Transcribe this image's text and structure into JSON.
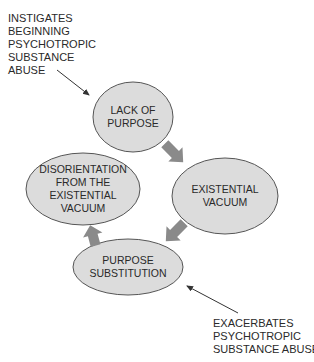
{
  "colors": {
    "node_fill": "#dcdcdc",
    "node_stroke": "#555555",
    "cycle_arrow_fill": "#8a8a8a",
    "pointer_arrow": "#333333",
    "text": "#2a2a2a"
  },
  "annotations": {
    "top": {
      "lines": [
        "INSTIGATES",
        "BEGINNING",
        "PSYCHOTROPIC",
        "SUBSTANCE",
        "ABUSE"
      ]
    },
    "bottom": {
      "lines": [
        "EXACERBATES",
        "PSYCHOTROPIC",
        "SUBSTANCE ABUSE"
      ]
    }
  },
  "nodes": [
    {
      "id": "lack-of-purpose",
      "lines": [
        "LACK OF",
        "PURPOSE"
      ]
    },
    {
      "id": "existential-vacuum",
      "lines": [
        "EXISTENTIAL",
        "VACUUM"
      ]
    },
    {
      "id": "purpose-substitution",
      "lines": [
        "PURPOSE",
        "SUBSTITUTION"
      ]
    },
    {
      "id": "disorientation",
      "lines": [
        "DISORIENTATION",
        "FROM THE",
        "EXISTENTIAL",
        "VACUUM"
      ]
    }
  ],
  "cycle": [
    {
      "from": "lack-of-purpose",
      "to": "existential-vacuum"
    },
    {
      "from": "existential-vacuum",
      "to": "purpose-substitution"
    },
    {
      "from": "purpose-substitution",
      "to": "disorientation"
    }
  ],
  "pointers": [
    {
      "from": "annotation-top",
      "to": "lack-of-purpose"
    },
    {
      "from": "annotation-bottom",
      "to": "purpose-substitution"
    }
  ]
}
